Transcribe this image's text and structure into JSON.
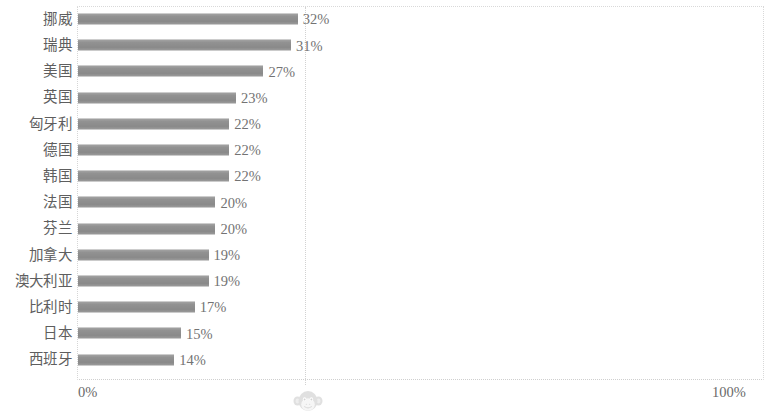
{
  "chart_data": {
    "type": "bar",
    "orientation": "horizontal",
    "title": "",
    "subtitle": "",
    "xlabel": "",
    "ylabel": "",
    "xlim": [
      0,
      100
    ],
    "xtick_labels": [
      "0%",
      "100%"
    ],
    "xticks": [
      0,
      100
    ],
    "grid": "vertical dotted gridline at 33%",
    "gridline_values": [
      33
    ],
    "legend": null,
    "value_suffix": "%",
    "bar_color": "#919191",
    "categories": [
      "挪威",
      "瑞典",
      "美国",
      "英国",
      "匈牙利",
      "德国",
      "韩国",
      "法国",
      "芬兰",
      "加拿大",
      "澳大利亚",
      "比利时",
      "日本",
      "西班牙"
    ],
    "values": [
      32,
      31,
      27,
      23,
      22,
      22,
      22,
      20,
      20,
      19,
      19,
      17,
      15,
      14
    ],
    "value_labels": [
      "32%",
      "31%",
      "27%",
      "23%",
      "22%",
      "22%",
      "22%",
      "20%",
      "20%",
      "19%",
      "19%",
      "17%",
      "15%",
      "14%"
    ],
    "rows": [
      {
        "label": "挪威",
        "value": 32,
        "value_label": "32%"
      },
      {
        "label": "瑞典",
        "value": 31,
        "value_label": "31%"
      },
      {
        "label": "美国",
        "value": 27,
        "value_label": "27%"
      },
      {
        "label": "英国",
        "value": 23,
        "value_label": "23%"
      },
      {
        "label": "匈牙利",
        "value": 22,
        "value_label": "22%"
      },
      {
        "label": "德国",
        "value": 22,
        "value_label": "22%"
      },
      {
        "label": "韩国",
        "value": 22,
        "value_label": "22%"
      },
      {
        "label": "法国",
        "value": 20,
        "value_label": "20%"
      },
      {
        "label": "芬兰",
        "value": 20,
        "value_label": "20%"
      },
      {
        "label": "加拿大",
        "value": 19,
        "value_label": "19%"
      },
      {
        "label": "澳大利亚",
        "value": 19,
        "value_label": "19%"
      },
      {
        "label": "比利时",
        "value": 17,
        "value_label": "17%"
      },
      {
        "label": "日本",
        "value": 15,
        "value_label": "15%"
      },
      {
        "label": "西班牙",
        "value": 14,
        "value_label": "14%"
      }
    ]
  },
  "axis": {
    "left_tick": "0%",
    "right_tick": "100%"
  },
  "watermark": {
    "icon": "monkey-face-icon"
  },
  "colors": {
    "bar": "#919191",
    "text": "#6a6a6a",
    "grid": "#d2d2d2",
    "background": "#ffffff"
  }
}
